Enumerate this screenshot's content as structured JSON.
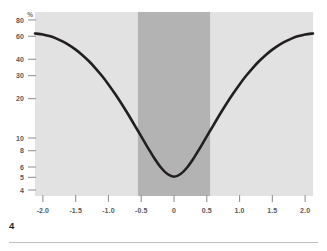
{
  "figure": {
    "number_label": "4",
    "unit_label": "%"
  },
  "chart_data": {
    "type": "line",
    "title": "",
    "xlabel": "",
    "ylabel": "%",
    "yscale": "log",
    "xscale": "linear",
    "grid": false,
    "legend": null,
    "xlim": [
      -2.12,
      2.12
    ],
    "ylim": [
      3.6,
      92
    ],
    "x_tick_values": [
      -2.0,
      -1.5,
      -1.0,
      -0.5,
      0,
      0.5,
      1.0,
      1.5,
      2.0
    ],
    "x_tick_labels": [
      "-2.0",
      "-1.5",
      "-1.0",
      "-0.5",
      "0",
      "0.5",
      "1.0",
      "1.5",
      "2.0"
    ],
    "y_tick_values": [
      80,
      60,
      40,
      30,
      20,
      10,
      8,
      6,
      5,
      4
    ],
    "y_tick_labels": [
      "80",
      "60",
      "40",
      "30",
      "20",
      "10",
      "8",
      "6",
      "5",
      "4"
    ],
    "series": [
      {
        "name": "curve",
        "color": "#231f20",
        "line_width": 2.6,
        "x": [
          -2.12,
          -2.0,
          -1.9,
          -1.8,
          -1.7,
          -1.6,
          -1.5,
          -1.4,
          -1.3,
          -1.2,
          -1.1,
          -1.0,
          -0.9,
          -0.8,
          -0.7,
          -0.6,
          -0.5,
          -0.4,
          -0.3,
          -0.2,
          -0.1,
          0,
          0.1,
          0.2,
          0.3,
          0.4,
          0.5,
          0.6,
          0.7,
          0.8,
          0.9,
          1.0,
          1.1,
          1.2,
          1.3,
          1.4,
          1.5,
          1.6,
          1.7,
          1.8,
          1.9,
          2.0,
          2.12
        ],
        "y": [
          63.0,
          62.0,
          60.2,
          57.8,
          54.8,
          51.3,
          47.4,
          43.2,
          38.8,
          34.3,
          29.9,
          25.7,
          21.8,
          18.3,
          15.2,
          12.5,
          10.3,
          8.45,
          7.0,
          5.95,
          5.3,
          5.05,
          5.3,
          5.95,
          7.0,
          8.45,
          10.3,
          12.5,
          15.2,
          18.3,
          21.8,
          25.7,
          29.9,
          34.3,
          38.8,
          43.2,
          47.4,
          51.3,
          54.8,
          57.8,
          60.2,
          62.0,
          63.0
        ]
      }
    ],
    "bands": [
      {
        "name": "highlight-band",
        "x_start": -0.55,
        "x_end": 0.55,
        "color": "#b3b3b3"
      }
    ],
    "plot_background": "#e2e2e2",
    "annotations": []
  }
}
